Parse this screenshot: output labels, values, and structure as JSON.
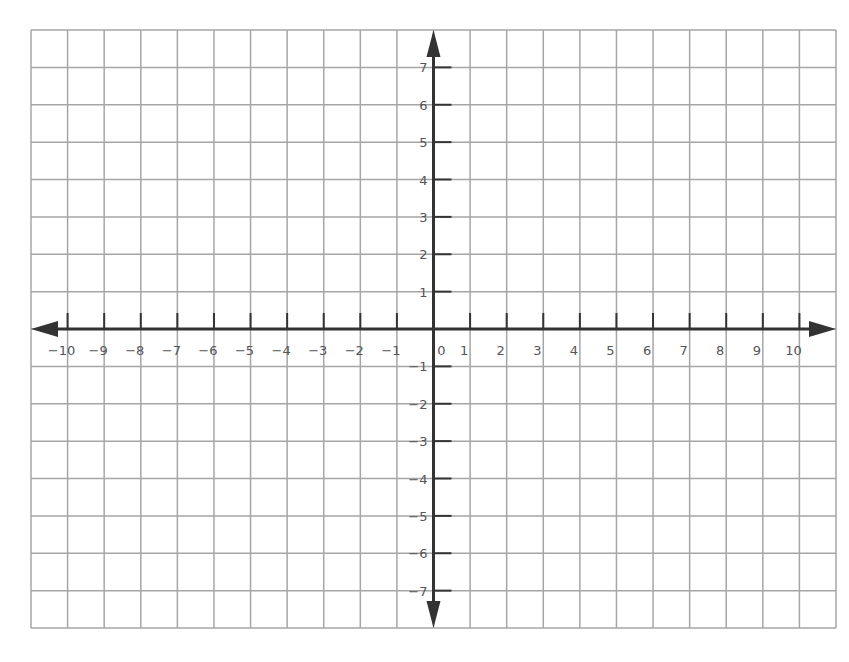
{
  "chart_data": {
    "type": "scatter",
    "title": "",
    "xlabel": "",
    "ylabel": "",
    "xlim": [
      -11,
      11
    ],
    "ylim": [
      -8,
      8
    ],
    "grid": true,
    "legend": null,
    "x_ticks": [
      -10,
      -9,
      -8,
      -7,
      -6,
      -5,
      -4,
      -3,
      -2,
      -1,
      0,
      1,
      2,
      3,
      4,
      5,
      6,
      7,
      8,
      9,
      10
    ],
    "x_tick_labels": [
      "−10",
      "−9",
      "−8",
      "−7",
      "−6",
      "−5",
      "−4",
      "−3",
      "−2",
      "−1",
      "0",
      "1",
      "2",
      "3",
      "4",
      "5",
      "6",
      "7",
      "8",
      "9",
      "10"
    ],
    "y_ticks": [
      7,
      6,
      5,
      4,
      3,
      2,
      1,
      -1,
      -2,
      -3,
      -4,
      -5,
      -6,
      -7
    ],
    "y_tick_labels": [
      "7",
      "6",
      "5",
      "4",
      "3",
      "2",
      "1",
      "−1",
      "−2",
      "−3",
      "−4",
      "−5",
      "−6",
      "−7"
    ],
    "series": []
  },
  "layout": {
    "grid_left": 31,
    "grid_top": 30,
    "grid_right": 836,
    "grid_bottom": 628,
    "cols": 22,
    "rows": 16,
    "origin_col": 11,
    "origin_row": 8
  },
  "colors": {
    "grid": "#a6a6a6",
    "axis": "#333333",
    "label": "#555555",
    "background": "#ffffff"
  }
}
